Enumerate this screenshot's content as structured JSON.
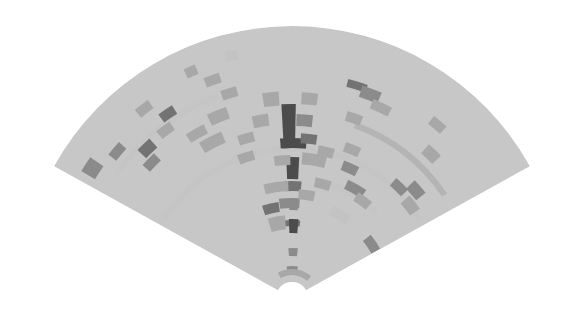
{
  "image": {
    "kind": "sector-scan sonar intensity image (grayscale fan)",
    "width": 586,
    "height": 320,
    "background": "#ffffff"
  },
  "fan": {
    "center": [
      292,
      298
    ],
    "outer_radius": 272,
    "inner_radius": 16,
    "angle_start_deg": -61,
    "angle_end_deg": 61,
    "base_color": "#c9c9c9",
    "noise": true
  },
  "palette": {
    "light": "#c4c4c4",
    "mid": "#9a9a9a",
    "dark": "#6e6e6e",
    "darker": "#4a4a4a",
    "black": "#111111"
  },
  "cells": [
    {
      "a": -1,
      "r": 172,
      "da": 3.2,
      "dr": 44,
      "tone": "black"
    },
    {
      "a": 0.5,
      "r": 155,
      "da": 6.5,
      "dr": 10,
      "tone": "black"
    },
    {
      "a": 0.3,
      "r": 130,
      "da": 3.0,
      "dr": 22,
      "tone": "black"
    },
    {
      "a": 0.6,
      "r": 112,
      "da": 4.0,
      "dr": 10,
      "tone": "darker"
    },
    {
      "a": -1.5,
      "r": 95,
      "da": 5.0,
      "dr": 10,
      "tone": "dark"
    },
    {
      "a": 4,
      "r": 178,
      "da": 4,
      "dr": 12,
      "tone": "dark"
    },
    {
      "a": 6,
      "r": 160,
      "da": 4,
      "dr": 10,
      "tone": "darker"
    },
    {
      "a": 9,
      "r": 140,
      "da": 6,
      "dr": 12,
      "tone": "mid"
    },
    {
      "a": 5,
      "r": 200,
      "da": 4,
      "dr": 12,
      "tone": "mid"
    },
    {
      "a": -6,
      "r": 200,
      "da": 4,
      "dr": 14,
      "tone": "mid"
    },
    {
      "a": -10,
      "r": 180,
      "da": 4,
      "dr": 12,
      "tone": "mid"
    },
    {
      "a": -4,
      "r": 138,
      "da": 4,
      "dr": 10,
      "tone": "mid"
    },
    {
      "a": 0,
      "r": 75,
      "da": 4,
      "dr": 6,
      "tone": "darker"
    },
    {
      "a": 1,
      "r": 92,
      "da": 2.2,
      "dr": 8,
      "tone": "dark"
    },
    {
      "a": 1.2,
      "r": 72,
      "da": 2.2,
      "dr": 14,
      "tone": "black"
    },
    {
      "a": 1.3,
      "r": 46,
      "da": 2.2,
      "dr": 8,
      "tone": "dark"
    },
    {
      "a": 0.4,
      "r": 28,
      "da": 2.5,
      "dr": 8,
      "tone": "dark"
    },
    {
      "a": 6,
      "r": 26,
      "da": 8,
      "dr": 6,
      "tone": "mid"
    },
    {
      "a": -13,
      "r": 92,
      "da": 4,
      "dr": 10,
      "tone": "darker"
    },
    {
      "a": -11,
      "r": 76,
      "da": 4,
      "dr": 14,
      "tone": "mid"
    },
    {
      "a": -8,
      "r": 112,
      "da": 6,
      "dr": 10,
      "tone": "mid"
    },
    {
      "a": 17,
      "r": 222,
      "da": 5,
      "dr": 8,
      "tone": "darker"
    },
    {
      "a": 21,
      "r": 218,
      "da": 5,
      "dr": 12,
      "tone": "dark"
    },
    {
      "a": 25,
      "r": 210,
      "da": 5,
      "dr": 10,
      "tone": "mid"
    },
    {
      "a": 19,
      "r": 190,
      "da": 4,
      "dr": 10,
      "tone": "mid"
    },
    {
      "a": 22,
      "r": 160,
      "da": 4,
      "dr": 10,
      "tone": "mid"
    },
    {
      "a": 24,
      "r": 142,
      "da": 4,
      "dr": 10,
      "tone": "dark"
    },
    {
      "a": 30,
      "r": 126,
      "da": 5,
      "dr": 10,
      "tone": "dark"
    },
    {
      "a": 36,
      "r": 120,
      "da": 4,
      "dr": 10,
      "tone": "mid"
    },
    {
      "a": 44,
      "r": 154,
      "da": 4,
      "dr": 10,
      "tone": "dark"
    },
    {
      "a": 49,
      "r": 164,
      "da": 4,
      "dr": 12,
      "tone": "dark"
    },
    {
      "a": 52,
      "r": 150,
      "da": 4,
      "dr": 12,
      "tone": "mid"
    },
    {
      "a": 56,
      "r": 96,
      "da": 4,
      "dr": 10,
      "tone": "dark"
    },
    {
      "a": 44,
      "r": 200,
      "da": 4,
      "dr": 12,
      "tone": "mid"
    },
    {
      "a": 40,
      "r": 226,
      "da": 4,
      "dr": 10,
      "tone": "mid"
    },
    {
      "a": 13,
      "r": 150,
      "da": 4,
      "dr": 10,
      "tone": "mid"
    },
    {
      "a": 15,
      "r": 118,
      "da": 4,
      "dr": 10,
      "tone": "mid"
    },
    {
      "a": -34,
      "r": 222,
      "da": 4,
      "dr": 10,
      "tone": "darker"
    },
    {
      "a": -37,
      "r": 210,
      "da": 4,
      "dr": 10,
      "tone": "mid"
    },
    {
      "a": -38,
      "r": 240,
      "da": 4,
      "dr": 10,
      "tone": "mid"
    },
    {
      "a": -44,
      "r": 208,
      "da": 4,
      "dr": 12,
      "tone": "darker"
    },
    {
      "a": -46,
      "r": 195,
      "da": 4,
      "dr": 10,
      "tone": "dark"
    },
    {
      "a": -50,
      "r": 228,
      "da": 4,
      "dr": 10,
      "tone": "dark"
    },
    {
      "a": -57,
      "r": 238,
      "da": 4,
      "dr": 16,
      "tone": "dark"
    },
    {
      "a": -30,
      "r": 190,
      "da": 5,
      "dr": 10,
      "tone": "mid"
    },
    {
      "a": -27,
      "r": 175,
      "da": 6,
      "dr": 12,
      "tone": "mid"
    },
    {
      "a": -22,
      "r": 196,
      "da": 5,
      "dr": 12,
      "tone": "mid"
    },
    {
      "a": -20,
      "r": 232,
      "da": 4,
      "dr": 10,
      "tone": "mid"
    },
    {
      "a": -17,
      "r": 214,
      "da": 4,
      "dr": 10,
      "tone": "mid"
    },
    {
      "a": -24,
      "r": 248,
      "da": 3,
      "dr": 10,
      "tone": "mid"
    },
    {
      "a": -14,
      "r": 250,
      "da": 3,
      "dr": 10,
      "tone": "light"
    },
    {
      "a": -16,
      "r": 166,
      "da": 4,
      "dr": 10,
      "tone": "mid"
    },
    {
      "a": -18,
      "r": 148,
      "da": 4,
      "dr": 10,
      "tone": "mid"
    },
    {
      "a": 30,
      "r": 96,
      "da": 5,
      "dr": 10,
      "tone": "light"
    },
    {
      "a": 8,
      "r": 104,
      "da": 4,
      "dr": 10,
      "tone": "mid"
    }
  ],
  "arcs": [
    {
      "r": 150,
      "a0": -58,
      "a1": 58,
      "tone": "light"
    },
    {
      "r": 184,
      "a0": 20,
      "a1": 56,
      "tone": "mid"
    },
    {
      "r": 215,
      "a0": -55,
      "a1": -20,
      "tone": "light"
    },
    {
      "r": 120,
      "a0": 15,
      "a1": 45,
      "tone": "light"
    }
  ],
  "ghost_text": [
    {
      "x": 310,
      "y": 254,
      "text": "—"
    },
    {
      "x": 300,
      "y": 278,
      "text": "—"
    },
    {
      "x": 300,
      "y": 300,
      "text": "—"
    }
  ]
}
